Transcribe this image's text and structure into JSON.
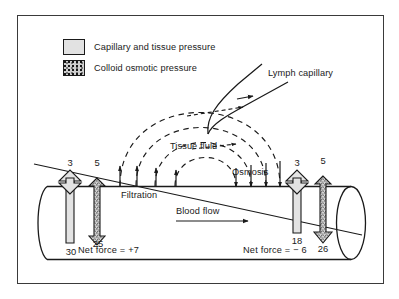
{
  "figure": {
    "frame_color": "#3a3a3a",
    "ink_color": "#1a1a1a"
  },
  "legend": {
    "items": [
      {
        "swatch": "plain-gray-box",
        "label": "Capillary and tissue pressure",
        "color": "#e2e2e2"
      },
      {
        "swatch": "stippled-box",
        "label": "Colloid osmotic pressure",
        "color": "#cfcfcf"
      }
    ]
  },
  "labels": {
    "lymph_capillary": "Lymph capillary",
    "tissue_fluid": "Tissue fluid",
    "filtration": "Filtration",
    "osmosis": "Osmosis",
    "blood_flow": "Blood flow"
  },
  "arterial_end": {
    "tissue_pressure": "3",
    "tissue_osmotic": "5",
    "capillary_pressure": "30",
    "plasma_osmotic": "25",
    "net_force": "Net force =  +7"
  },
  "venous_end": {
    "tissue_pressure": "3",
    "tissue_osmotic": "5",
    "capillary_pressure": "18",
    "plasma_osmotic": "26",
    "net_force": "Net force =  − 6"
  }
}
